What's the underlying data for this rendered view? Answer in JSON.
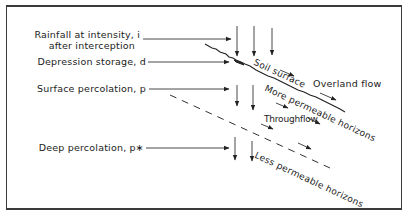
{
  "diagram": {
    "type": "hillslope hydrology schematic",
    "labels": {
      "rainfall_line1": "Rainfall  at  intensity, i",
      "rainfall_line2": "after  interception",
      "depression": "Depression  storage,  d",
      "surface_perc": "Surface  percolation,  p",
      "deep_perc": "Deep  percolation,  p∗"
    },
    "annotations": {
      "soil_surface": "Soil  surface",
      "overland_flow": "Overland  flow",
      "more_permeable": "More  permeable  horizons",
      "throughflow": "Throughflow",
      "less_permeable": "Less  permeable  horizons"
    },
    "colors": {
      "ink": "#222222",
      "frame": "#3a3a3a",
      "background": "#ffffff"
    }
  }
}
